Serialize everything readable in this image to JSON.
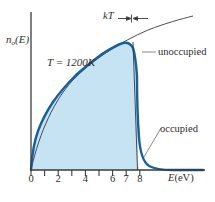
{
  "figure": {
    "name": "fermi-dirac-occupied-states-distribution",
    "background_color": "#ffffff"
  },
  "axes": {
    "y_label_main": "n",
    "y_label_sub": "o",
    "y_label_tail": "(E)",
    "x_label_symbol": "E",
    "x_label_unit": "(eV)",
    "axis_color": "#3a3a3a"
  },
  "annotations": {
    "temperature": "T = 1200K",
    "kt": "kT",
    "unoccupied": "unoccupied",
    "occupied": "occupied"
  },
  "colors": {
    "fill": "#c5e3f3",
    "curve": "#17609e",
    "dos_line": "#3a3a3a",
    "leader_line": "#6b6b6b"
  },
  "chart_data": {
    "type": "area",
    "title": "",
    "subtitle": "",
    "xlabel": "E(eV)",
    "ylabel": "n_o(E)",
    "xlim": [
      0,
      8.6
    ],
    "ylim": [
      0,
      1.18
    ],
    "grid": false,
    "legend_position": "none",
    "x_ticks": [
      0,
      1,
      2,
      3,
      4,
      5,
      6,
      7,
      8
    ],
    "x_tick_labels": [
      "0",
      "",
      "2",
      "",
      "4",
      "",
      "6",
      "7",
      "8"
    ],
    "x_major_labeled": [
      {
        "value": 0,
        "label": "0"
      },
      {
        "value": 2,
        "label": "2"
      },
      {
        "value": 4,
        "label": "4"
      },
      {
        "value": 6,
        "label": "6"
      },
      {
        "value": 7,
        "label": "7"
      },
      {
        "value": 8,
        "label": "8"
      }
    ],
    "y_ticks": [],
    "y_tick_labels": [],
    "annotations": [
      {
        "text": "T = 1200K",
        "x": 2.0,
        "y": 0.92,
        "kind": "text"
      },
      {
        "text": "kT",
        "x": 5.6,
        "y": 1.14,
        "kind": "text"
      },
      {
        "text": "unoccupied",
        "x": 8.0,
        "y": 0.88,
        "kind": "callout",
        "points_to_x": 7.0,
        "points_to_y": 0.8
      },
      {
        "text": "occupied",
        "x": 8.1,
        "y": 0.36,
        "kind": "callout",
        "points_to_x": 7.05,
        "points_to_y": 0.06
      }
    ],
    "fermi_energy_eV": 7.0,
    "temperature_K": 1200,
    "kt_bracket": {
      "center_x": 7.0,
      "half_width_eV": 0.35,
      "y": 1.13
    },
    "series": [
      {
        "name": "density of states (unoccupied continuation)",
        "style": "thin-dark-line",
        "comment": "sqrt(E) density-of-states curve extending past E_F",
        "x": [
          0.0,
          0.5,
          1.0,
          1.5,
          2.0,
          2.5,
          3.0,
          3.5,
          4.0,
          4.5,
          5.0,
          5.5,
          6.0,
          6.5,
          7.0,
          7.5,
          8.0,
          8.5
        ],
        "y": [
          0.0,
          0.24,
          0.33,
          0.41,
          0.47,
          0.53,
          0.58,
          0.62,
          0.66,
          0.7,
          0.74,
          0.78,
          0.81,
          0.85,
          0.88,
          0.91,
          0.94,
          0.97
        ]
      },
      {
        "name": "occupied states n_o(E)",
        "style": "thick-blue-filled",
        "comment": "density of states multiplied by Fermi-Dirac occupancy at 1200K",
        "x": [
          0.0,
          0.25,
          0.5,
          1.0,
          1.5,
          2.0,
          2.5,
          3.0,
          3.5,
          4.0,
          4.5,
          5.0,
          5.5,
          6.0,
          6.3,
          6.6,
          6.8,
          6.9,
          7.0,
          7.1,
          7.2,
          7.35,
          7.5,
          7.8,
          8.2,
          8.6
        ],
        "y": [
          0.0,
          0.17,
          0.24,
          0.33,
          0.41,
          0.47,
          0.53,
          0.58,
          0.62,
          0.66,
          0.7,
          0.74,
          0.78,
          0.81,
          0.82,
          0.81,
          0.75,
          0.66,
          0.44,
          0.22,
          0.11,
          0.05,
          0.03,
          0.015,
          0.008,
          0.005
        ]
      }
    ]
  }
}
